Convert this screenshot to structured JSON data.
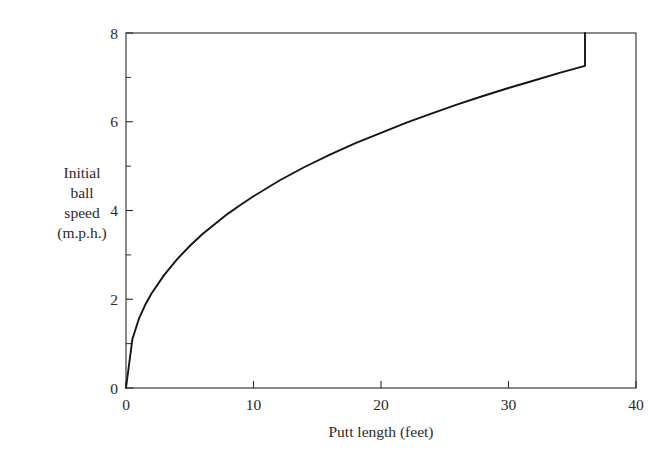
{
  "chart_data": {
    "type": "line",
    "title": "",
    "subtitle": "",
    "xlabel": "Putt length (feet)",
    "ylabel": "Initial ball speed (m.p.h.)",
    "ylabel_lines": [
      "Initial",
      "ball",
      "speed",
      "(m.p.h.)"
    ],
    "xlim": [
      0,
      40
    ],
    "ylim": [
      0,
      8
    ],
    "x_major_ticks": [
      0,
      10,
      20,
      30,
      40
    ],
    "x_tick_labels": [
      "0",
      "10",
      "20",
      "30",
      "40"
    ],
    "y_major_ticks": [
      0,
      2,
      4,
      6,
      8
    ],
    "y_tick_labels": [
      "0",
      "2",
      "4",
      "6",
      "8"
    ],
    "y_minor_ticks": [
      1,
      3,
      5,
      7
    ],
    "grid": false,
    "legend": false,
    "legend_position": "none",
    "series": [
      {
        "name": "Initial ball speed",
        "x": [
          0,
          0.5,
          1,
          1.5,
          2,
          3,
          4,
          5,
          6,
          7,
          8,
          9,
          10,
          12,
          14,
          16,
          18,
          20,
          22,
          24,
          26,
          28,
          30,
          32,
          34,
          36
        ],
        "values": [
          0,
          1.1,
          1.55,
          1.87,
          2.13,
          2.55,
          2.9,
          3.2,
          3.47,
          3.7,
          3.93,
          4.13,
          4.32,
          4.67,
          4.98,
          5.26,
          5.52,
          5.75,
          5.98,
          6.19,
          6.39,
          6.58,
          6.76,
          6.93,
          7.1,
          7.26
        ]
      }
    ],
    "curve_endpoint": {
      "x": 36,
      "y": 8
    },
    "curve_origin": {
      "x": 0,
      "y": 0
    },
    "line_color": "#151515",
    "axis_color": "#2b2b2b",
    "background_color": "#ffffff"
  },
  "axes": {
    "x_axis_name": "Putt length (feet)",
    "y_axis_name": "Initial ball speed (m.p.h.)"
  }
}
